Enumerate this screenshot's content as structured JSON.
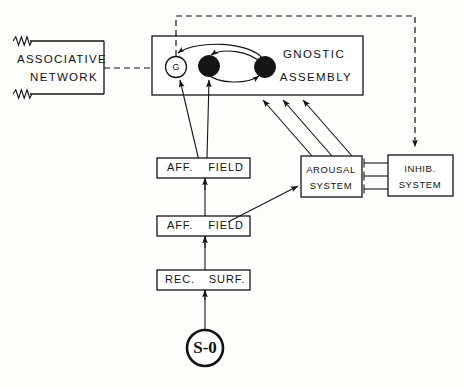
{
  "diagram": {
    "colors": {
      "ink": "#141414",
      "paper": "#fdfdfc",
      "node_fill": "#151515"
    },
    "boxes": {
      "associative_network": {
        "line1": "ASSOCIATIVE",
        "line2": "NETWORK"
      },
      "gnostic_assembly": {
        "line1": "GNOSTIC",
        "line2": "ASSEMBLY"
      },
      "arousal_system": {
        "line1": "AROUSAL",
        "line2": "SYSTEM"
      },
      "inhib_system": {
        "line1": "INHIB.",
        "line2": "SYSTEM"
      },
      "aff_field_upper": {
        "left": "AFF.",
        "right": "FIELD"
      },
      "aff_field_lower": {
        "left": "AFF.",
        "right": "FIELD"
      },
      "rec_surf": {
        "left": "REC.",
        "right": "SURF."
      }
    },
    "nodes": {
      "gnostic_unit": "G",
      "stimulus": "S-0"
    },
    "icons": {
      "squiggle_top": "squiggle-icon",
      "squiggle_bottom": "squiggle-icon",
      "arrowhead": "arrowhead-icon",
      "inhibitory_terminal": "t-bar-icon"
    }
  }
}
